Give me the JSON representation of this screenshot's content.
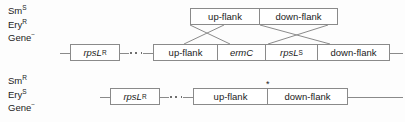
{
  "diagram": {
    "line_color": "#8a8a8a",
    "text_color": "#1b1b1b",
    "background": "#fdfdfd"
  },
  "phenotype_top": {
    "line1_base": "Sm",
    "line1_sup": "S",
    "line2_base": "Ery",
    "line2_sup": "R",
    "line3_base": "Gene",
    "line3_sup": "−"
  },
  "phenotype_bottom": {
    "line1_base": "Sm",
    "line1_sup": "R",
    "line2_base": "Ery",
    "line2_sup": "S",
    "line3_base": "Gene",
    "line3_sup": "−"
  },
  "construct_top": {
    "cells": [
      {
        "label": "up-flank"
      },
      {
        "label": "down-flank"
      }
    ]
  },
  "chromosome_middle": {
    "marker_base": "rpsL",
    "marker_sup": "R",
    "cells": [
      {
        "label": "up-flank",
        "italic": false
      },
      {
        "label": "ermC",
        "italic": true
      },
      {
        "label": "rpsL",
        "sup": "S",
        "italic": true
      },
      {
        "label": "down-flank",
        "italic": false
      }
    ]
  },
  "chromosome_bottom": {
    "marker_base": "rpsL",
    "marker_sup": "R",
    "asterisk": "*",
    "cells": [
      {
        "label": "up-flank"
      },
      {
        "label": "down-flank"
      }
    ]
  }
}
